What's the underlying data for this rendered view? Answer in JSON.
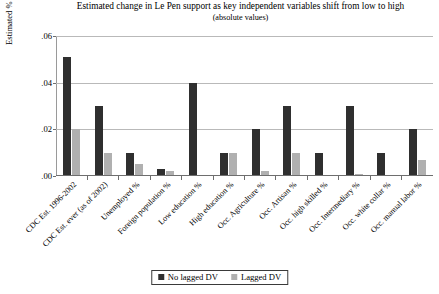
{
  "chart_data": {
    "type": "bar",
    "title": "Estimated change in Le Pen support as key independent variables shift from low to high",
    "subtitle": "(absolute values)",
    "xlabel": "",
    "ylabel": "Estimated % Δ in Le Pen support",
    "ylim": [
      0,
      0.06
    ],
    "yticks": [
      0.0,
      0.02,
      0.04,
      0.06
    ],
    "ytick_labels": [
      ".00",
      ".02",
      ".04",
      ".06"
    ],
    "grid": true,
    "legend_position": "bottom-center",
    "categories": [
      "CDC Est. 1996-2002",
      "CDC Est. ever (as of 2002)",
      "Unemployed %",
      "Foreign population %",
      "Low education %",
      "High education %",
      "Occ. Agriculture %",
      "Occ. Artisan %",
      "Occ. high skilled %",
      "Occ. Intermediary %",
      "Occ. white collar %",
      "Occ. manual labor %"
    ],
    "series": [
      {
        "name": "No lagged DV",
        "color": "#2f2f2f",
        "values": [
          0.051,
          0.03,
          0.01,
          0.003,
          0.04,
          0.01,
          0.02,
          0.03,
          0.01,
          0.03,
          0.01,
          0.02
        ]
      },
      {
        "name": "Lagged DV",
        "color": "#b0b0b0",
        "values": [
          0.02,
          0.01,
          0.005,
          0.002,
          0.0,
          0.01,
          0.002,
          0.01,
          0.0,
          0.001,
          0.0,
          0.007
        ]
      }
    ]
  }
}
